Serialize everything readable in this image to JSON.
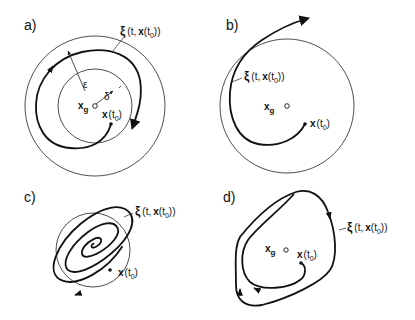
{
  "figure": {
    "panels": [
      {
        "id": "a",
        "label": "a)",
        "trajectory_label": "ξ(t, x(t₀))",
        "xi": "ξ",
        "xi_args": "(t,",
        "x": "x",
        "t0_open": "(t",
        "sub0": "0",
        "close2": "))",
        "close1": ")",
        "equilibrium": "x",
        "equilibrium_sub": "g",
        "initial_state": "x",
        "initial_open": "(t",
        "initial_sub": "0",
        "initial_close": ")",
        "epsilon": "ε",
        "delta": "δ",
        "description": "Stable: trajectory starting in δ-ball stays within ε-ball"
      },
      {
        "id": "b",
        "label": "b)",
        "trajectory_label": "ξ(t, x(t₀))",
        "xi": "ξ",
        "xi_args": "(t,",
        "x": "x",
        "t0_open": "(t",
        "sub0": "0",
        "close2": "))",
        "close1": ")",
        "equilibrium": "x",
        "equilibrium_sub": "g",
        "initial_state": "x",
        "initial_open": "(t",
        "initial_sub": "0",
        "initial_close": ")",
        "description": "Unstable: trajectory leaves the ball"
      },
      {
        "id": "c",
        "label": "c)",
        "trajectory_label": "ξ(t, x(t₀))",
        "xi": "ξ",
        "xi_args": "(t,",
        "x": "x",
        "t0_open": "(t",
        "sub0": "0",
        "close2": "))",
        "initial_state": "x",
        "initial_open": "(t",
        "initial_sub": "0",
        "initial_close": ")",
        "description": "Asymptotically stable: spiral converging to equilibrium"
      },
      {
        "id": "d",
        "label": "d)",
        "trajectory_label": "ξ(t, x(t₀))",
        "xi": "ξ",
        "xi_args": "(t,",
        "x": "x",
        "t0_open": "(t",
        "sub0": "0",
        "close2": "))",
        "equilibrium": "x",
        "equilibrium_sub": "g",
        "initial_state": "x",
        "initial_open": "(t",
        "initial_sub": "0",
        "initial_close": ")",
        "description": "Limit cycle: trajectory approaches closed orbit"
      }
    ]
  }
}
